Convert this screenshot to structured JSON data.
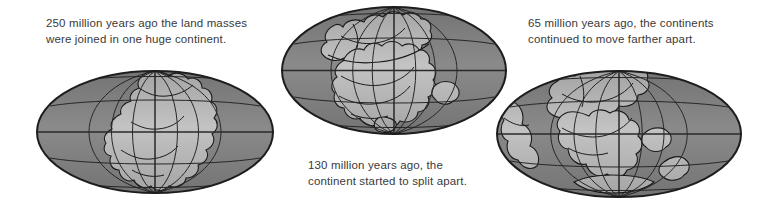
{
  "figure": {
    "background_color": "#ffffff",
    "width": 759,
    "height": 216
  },
  "palette": {
    "ocean": "#8a8a8a",
    "ocean_shaded": "#7e7e7e",
    "land": "#c3c3c3",
    "land_shaded": "#b4b4b4",
    "outline": "#1d1d1d",
    "graticule": "#2a2a2a",
    "text": "#3a3a3a"
  },
  "captions": [
    {
      "id": "caption-250ma",
      "text": "250 million years ago the land masses were joined in one huge continent.",
      "lines": [
        "250 million years ago the land",
        "masses were joined in one huge",
        "continent."
      ],
      "x": 46,
      "y": 16
    },
    {
      "id": "caption-130ma",
      "text": "130 million years ago, the continent started to split apart.",
      "lines": [
        "130 million years ago, the",
        "continent started to split",
        "apart."
      ],
      "x": 308,
      "y": 158
    },
    {
      "id": "caption-65ma",
      "text": "65 million years ago, the continents continued to move farther apart.",
      "lines": [
        "65 million years ago, the continents",
        "continued to move farther apart."
      ],
      "x": 528,
      "y": 16
    }
  ],
  "globes": [
    {
      "id": "globe-250ma",
      "label": "250 million years ago — Pangaea",
      "projection": "mollweide",
      "x": 36,
      "y": 70,
      "width": 238,
      "height": 124,
      "meridian_spacing_deg": 30,
      "parallel_spacing_deg": 30
    },
    {
      "id": "globe-130ma",
      "label": "130 million years ago — continent splitting",
      "projection": "mollweide",
      "x": 281,
      "y": 6,
      "width": 226,
      "height": 129,
      "meridian_spacing_deg": 30,
      "parallel_spacing_deg": 30
    },
    {
      "id": "globe-65ma",
      "label": "65 million years ago — continents farther apart",
      "projection": "mollweide",
      "x": 496,
      "y": 70,
      "width": 246,
      "height": 128,
      "meridian_spacing_deg": 30,
      "parallel_spacing_deg": 30
    }
  ]
}
